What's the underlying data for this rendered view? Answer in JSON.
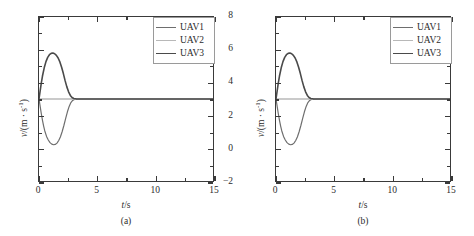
{
  "figure": {
    "panels": [
      {
        "caption": "(a)",
        "chart_data": {
          "type": "line",
          "title": "",
          "xlabel": "t/s",
          "ylabel": "v/(m · s-1)",
          "xlim": [
            0,
            15
          ],
          "ylim": [
            -2,
            8
          ],
          "xticks": [
            0,
            5,
            10,
            15
          ],
          "yticks": [
            -2,
            0,
            2,
            4,
            6,
            8
          ],
          "xtick_labels": [
            "0",
            "5",
            "10",
            "15"
          ],
          "ytick_labels": [
            "-2",
            "0",
            "2",
            "4",
            "6",
            "8"
          ],
          "grid": false,
          "legend_position": "top-right",
          "series": [
            {
              "name": "UAV1",
              "color": "#6e6e6e",
              "width": 1.2,
              "points": [
                [
                  0.0,
                  3.0
                ],
                [
                  0.1,
                  2.55
                ],
                [
                  0.2,
                  2.1
                ],
                [
                  0.3,
                  1.7
                ],
                [
                  0.4,
                  1.35
                ],
                [
                  0.5,
                  1.05
                ],
                [
                  0.65,
                  0.72
                ],
                [
                  0.8,
                  0.5
                ],
                [
                  0.95,
                  0.34
                ],
                [
                  1.1,
                  0.25
                ],
                [
                  1.25,
                  0.21
                ],
                [
                  1.4,
                  0.23
                ],
                [
                  1.55,
                  0.31
                ],
                [
                  1.7,
                  0.47
                ],
                [
                  1.85,
                  0.7
                ],
                [
                  2.0,
                  1.02
                ],
                [
                  2.15,
                  1.4
                ],
                [
                  2.3,
                  1.82
                ],
                [
                  2.45,
                  2.22
                ],
                [
                  2.6,
                  2.55
                ],
                [
                  2.75,
                  2.78
                ],
                [
                  2.9,
                  2.91
                ],
                [
                  3.05,
                  2.97
                ],
                [
                  3.2,
                  2.99
                ],
                [
                  3.5,
                  3.0
                ],
                [
                  4.0,
                  3.0
                ],
                [
                  6.0,
                  3.0
                ],
                [
                  9.0,
                  3.0
                ],
                [
                  12.0,
                  3.0
                ],
                [
                  15.0,
                  3.0
                ]
              ]
            },
            {
              "name": "UAV2",
              "color": "#b8b8b8",
              "width": 1.5,
              "points": [
                [
                  0.0,
                  3.0
                ],
                [
                  2.0,
                  3.0
                ],
                [
                  5.0,
                  3.0
                ],
                [
                  10.0,
                  3.0
                ],
                [
                  15.0,
                  3.0
                ]
              ]
            },
            {
              "name": "UAV3",
              "color": "#4a4a4a",
              "width": 1.6,
              "points": [
                [
                  0.0,
                  3.0
                ],
                [
                  0.1,
                  3.5
                ],
                [
                  0.2,
                  3.98
                ],
                [
                  0.3,
                  4.4
                ],
                [
                  0.45,
                  4.9
                ],
                [
                  0.6,
                  5.28
                ],
                [
                  0.75,
                  5.54
                ],
                [
                  0.9,
                  5.7
                ],
                [
                  1.05,
                  5.78
                ],
                [
                  1.2,
                  5.8
                ],
                [
                  1.35,
                  5.76
                ],
                [
                  1.5,
                  5.66
                ],
                [
                  1.65,
                  5.5
                ],
                [
                  1.8,
                  5.26
                ],
                [
                  1.95,
                  4.94
                ],
                [
                  2.1,
                  4.55
                ],
                [
                  2.25,
                  4.12
                ],
                [
                  2.4,
                  3.74
                ],
                [
                  2.55,
                  3.44
                ],
                [
                  2.7,
                  3.22
                ],
                [
                  2.85,
                  3.09
                ],
                [
                  3.0,
                  3.03
                ],
                [
                  3.2,
                  3.01
                ],
                [
                  3.5,
                  3.0
                ],
                [
                  4.0,
                  3.0
                ],
                [
                  6.0,
                  3.0
                ],
                [
                  9.0,
                  3.0
                ],
                [
                  12.0,
                  3.0
                ],
                [
                  15.0,
                  3.0
                ]
              ]
            }
          ],
          "legend": [
            "UAV1",
            "UAV2",
            "UAV3"
          ]
        }
      },
      {
        "caption": "(b)",
        "chart_data": {
          "type": "line",
          "title": "",
          "xlabel": "t/s",
          "ylabel": "v/(m · s-1)",
          "xlim": [
            0,
            15
          ],
          "ylim": [
            -2,
            8
          ],
          "xticks": [
            0,
            5,
            10,
            15
          ],
          "yticks": [
            -2,
            0,
            2,
            4,
            6,
            8
          ],
          "xtick_labels": [
            "0",
            "5",
            "10",
            "15"
          ],
          "ytick_labels": [
            "-2",
            "0",
            "2",
            "4",
            "6",
            "8"
          ],
          "grid": false,
          "legend_position": "top-right",
          "series": [
            {
              "name": "UAV1",
              "color": "#6e6e6e",
              "width": 1.2,
              "points": [
                [
                  0.0,
                  3.0
                ],
                [
                  0.1,
                  2.55
                ],
                [
                  0.2,
                  2.1
                ],
                [
                  0.3,
                  1.7
                ],
                [
                  0.4,
                  1.35
                ],
                [
                  0.5,
                  1.05
                ],
                [
                  0.65,
                  0.72
                ],
                [
                  0.8,
                  0.5
                ],
                [
                  0.95,
                  0.34
                ],
                [
                  1.1,
                  0.25
                ],
                [
                  1.25,
                  0.21
                ],
                [
                  1.4,
                  0.23
                ],
                [
                  1.55,
                  0.31
                ],
                [
                  1.7,
                  0.47
                ],
                [
                  1.85,
                  0.7
                ],
                [
                  2.0,
                  1.02
                ],
                [
                  2.15,
                  1.4
                ],
                [
                  2.3,
                  1.82
                ],
                [
                  2.45,
                  2.22
                ],
                [
                  2.6,
                  2.55
                ],
                [
                  2.75,
                  2.78
                ],
                [
                  2.9,
                  2.91
                ],
                [
                  3.05,
                  2.97
                ],
                [
                  3.2,
                  2.99
                ],
                [
                  3.5,
                  3.0
                ],
                [
                  4.0,
                  3.0
                ],
                [
                  6.0,
                  3.0
                ],
                [
                  9.0,
                  3.0
                ],
                [
                  12.0,
                  3.0
                ],
                [
                  15.0,
                  3.0
                ]
              ]
            },
            {
              "name": "UAV2",
              "color": "#b8b8b8",
              "width": 1.5,
              "points": [
                [
                  0.0,
                  3.0
                ],
                [
                  2.0,
                  3.0
                ],
                [
                  5.0,
                  3.0
                ],
                [
                  10.0,
                  3.0
                ],
                [
                  15.0,
                  3.0
                ]
              ]
            },
            {
              "name": "UAV3",
              "color": "#4a4a4a",
              "width": 1.6,
              "points": [
                [
                  0.0,
                  3.0
                ],
                [
                  0.1,
                  3.5
                ],
                [
                  0.2,
                  3.98
                ],
                [
                  0.3,
                  4.4
                ],
                [
                  0.45,
                  4.9
                ],
                [
                  0.6,
                  5.28
                ],
                [
                  0.75,
                  5.54
                ],
                [
                  0.9,
                  5.7
                ],
                [
                  1.05,
                  5.78
                ],
                [
                  1.2,
                  5.8
                ],
                [
                  1.35,
                  5.76
                ],
                [
                  1.5,
                  5.66
                ],
                [
                  1.65,
                  5.5
                ],
                [
                  1.8,
                  5.26
                ],
                [
                  1.95,
                  4.94
                ],
                [
                  2.1,
                  4.55
                ],
                [
                  2.25,
                  4.12
                ],
                [
                  2.4,
                  3.74
                ],
                [
                  2.55,
                  3.44
                ],
                [
                  2.7,
                  3.22
                ],
                [
                  2.85,
                  3.09
                ],
                [
                  3.0,
                  3.03
                ],
                [
                  3.2,
                  3.01
                ],
                [
                  3.5,
                  3.0
                ],
                [
                  4.0,
                  3.0
                ],
                [
                  6.0,
                  3.0
                ],
                [
                  9.0,
                  3.0
                ],
                [
                  12.0,
                  3.0
                ],
                [
                  15.0,
                  3.0
                ]
              ]
            }
          ],
          "legend": [
            "UAV1",
            "UAV2",
            "UAV3"
          ]
        }
      }
    ]
  }
}
